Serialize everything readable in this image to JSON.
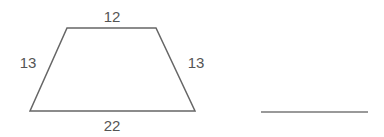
{
  "figure": {
    "shape": "isosceles-trapezoid",
    "stroke_color": "#666666",
    "label_color": "#555555",
    "labels": {
      "top": "12",
      "left": "13",
      "right": "13",
      "bottom": "22"
    },
    "answer_line": "blank"
  }
}
